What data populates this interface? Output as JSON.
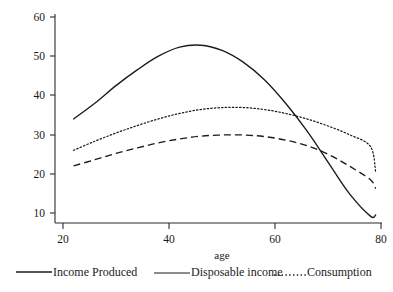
{
  "chart_data": {
    "type": "line",
    "title": "",
    "xlabel": "age",
    "ylabel": "",
    "xlim": [
      20,
      80
    ],
    "ylim": [
      8,
      62
    ],
    "grid": false,
    "legend_position": "bottom",
    "x_ticks": [
      "20",
      "40",
      "60",
      "80"
    ],
    "x_tick_values": [
      20,
      40,
      60,
      80
    ],
    "y_ticks": [
      "10",
      "20",
      "30",
      "40",
      "50",
      "60"
    ],
    "y_tick_values": [
      10,
      20,
      30,
      40,
      50,
      60
    ],
    "x": [
      22,
      26,
      30,
      34,
      38,
      42,
      46,
      50,
      54,
      58,
      62,
      66,
      70,
      74,
      78,
      79
    ],
    "series": [
      {
        "name": "Income Produced",
        "style": "solid",
        "values": [
          34,
          38,
          42.5,
          46.5,
          50,
          52.3,
          52.8,
          51.5,
          48.5,
          44,
          38,
          31,
          23,
          15,
          9.2,
          9.5
        ]
      },
      {
        "name": "Disposable income",
        "style": "dashed",
        "values": [
          22,
          23.6,
          25.2,
          26.6,
          27.9,
          28.9,
          29.6,
          29.9,
          29.9,
          29.5,
          28.6,
          27.2,
          25,
          22,
          18.5,
          16.2
        ]
      },
      {
        "name": "Consumption",
        "style": "dotted",
        "values": [
          26,
          28.3,
          30.4,
          32.3,
          34,
          35.4,
          36.4,
          36.9,
          36.9,
          36.4,
          35.4,
          34,
          32.2,
          30,
          27,
          20.4
        ]
      }
    ]
  },
  "legend": {
    "items": [
      {
        "label": "Income Produced",
        "style": "solid"
      },
      {
        "label": "Disposable income",
        "style": "thin"
      },
      {
        "label": "Consumption",
        "style": "dotted"
      }
    ]
  },
  "axes": {
    "x_title": "age"
  }
}
